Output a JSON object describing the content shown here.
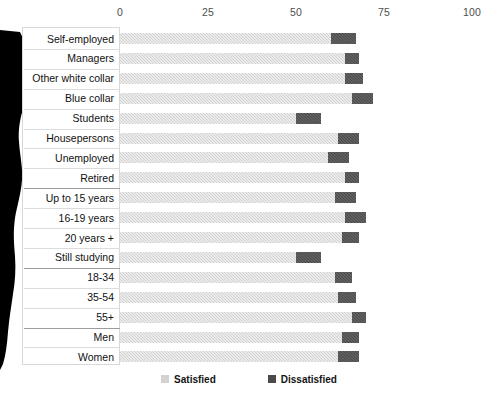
{
  "chart_data": {
    "type": "bar",
    "orientation": "horizontal",
    "stacked": true,
    "title": "",
    "xlabel": "",
    "ylabel": "",
    "xlim": [
      0,
      100
    ],
    "xticks": [
      0,
      25,
      50,
      75,
      100
    ],
    "grid": false,
    "legend_position": "bottom",
    "categories": [
      "Self-employed",
      "Managers",
      "Other white collar",
      "Blue collar",
      "Students",
      "Housepersons",
      "Unemployed",
      "Retired",
      "Up to 15 years",
      "16-19 years",
      "20 years +",
      "Still studying",
      "18-34",
      "35-54",
      "55+",
      "Men",
      "Women"
    ],
    "series": [
      {
        "name": "Satisfied",
        "color": "#d2d2d2",
        "values": [
          60,
          64,
          64,
          66,
          50,
          62,
          59,
          64,
          61,
          64,
          63,
          50,
          61,
          62,
          66,
          63,
          62
        ]
      },
      {
        "name": "Dissatisfied",
        "color": "#4a4a4a",
        "values": [
          7,
          4,
          5,
          6,
          7,
          6,
          6,
          4,
          6,
          6,
          5,
          7,
          5,
          5,
          4,
          5,
          6
        ]
      }
    ],
    "group_labels": [
      "Occupation",
      "Education",
      "Age",
      "Gender"
    ],
    "group_breaks": [
      8,
      12,
      15
    ]
  },
  "axis": {
    "ticks": [
      "0",
      "25",
      "50",
      "75",
      "100"
    ]
  },
  "legend": {
    "items": [
      {
        "label": "Satisfied",
        "swatch": "sat"
      },
      {
        "label": "Dissatisfied",
        "swatch": "dis"
      }
    ]
  }
}
